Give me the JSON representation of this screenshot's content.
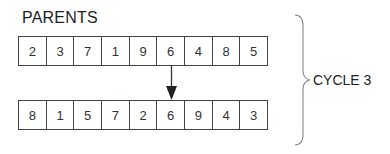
{
  "title": "PARENTS",
  "parent_top": {
    "cells": [
      "2",
      "3",
      "7",
      "1",
      "9",
      "6",
      "4",
      "8",
      "5"
    ]
  },
  "parent_bottom": {
    "cells": [
      "8",
      "1",
      "5",
      "7",
      "2",
      "6",
      "9",
      "4",
      "3"
    ]
  },
  "arrow": {
    "from_index": 5,
    "to_index": 5,
    "value": "6"
  },
  "brace_label": "CYCLE 3",
  "colors": {
    "line": "#444444",
    "text": "#222222",
    "background": "#ffffff"
  }
}
